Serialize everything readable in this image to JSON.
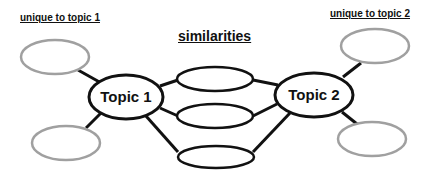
{
  "headings": {
    "unique_topic1": "unique to topic 1",
    "similarities": "similarities",
    "unique_topic2": "unique to topic 2"
  },
  "topics": {
    "topic1": "Topic 1",
    "topic2": "Topic 2"
  },
  "colors": {
    "outline_primary": "#111111",
    "outline_unique": "#a0a0a0",
    "background": "#ffffff"
  },
  "nodes": {
    "unique_topic1_count": 2,
    "similarities_count": 3,
    "unique_topic2_count": 2
  }
}
